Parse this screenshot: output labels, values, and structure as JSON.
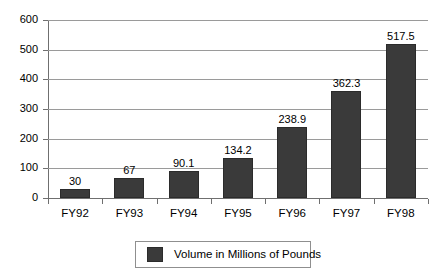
{
  "chart_data": {
    "type": "bar",
    "title": "",
    "subtitle": "",
    "xlabel": "",
    "ylabel": "",
    "categories": [
      "FY92",
      "FY93",
      "FY94",
      "FY95",
      "FY96",
      "FY97",
      "FY98"
    ],
    "values": [
      30,
      67,
      90.1,
      134.2,
      238.9,
      362.3,
      517.5
    ],
    "value_labels": [
      "30",
      "67",
      "90.1",
      "134.2",
      "238.9",
      "362.3",
      "517.5"
    ],
    "series": [
      {
        "name": "Volume in Millions of Pounds",
        "values": [
          30,
          67,
          90.1,
          134.2,
          238.9,
          362.3,
          517.5
        ],
        "color": "#3a3a3a"
      }
    ],
    "ylim": [
      0,
      600
    ],
    "y_ticks": [
      0,
      100,
      200,
      300,
      400,
      500,
      600
    ],
    "y_tick_labels": [
      "0",
      "100",
      "200",
      "300",
      "400",
      "500",
      "600"
    ],
    "grid": "horizontal",
    "legend": {
      "position": "bottom-center",
      "entries": [
        {
          "label": "Volume in Millions of Pounds",
          "color": "#3a3a3a"
        }
      ]
    },
    "colors": {
      "bar": "#3a3a3a",
      "bar_border": "#2b2b2b",
      "gridline": "#9a9a9a",
      "axis": "#6f6f6f",
      "text": "#000000",
      "background": "#ffffff",
      "legend_border": "#8f8f8f"
    }
  }
}
